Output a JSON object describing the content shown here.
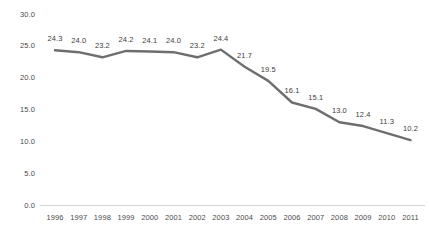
{
  "chart_data": {
    "type": "line",
    "title": "",
    "subtitle": "",
    "xlabel": "",
    "ylabel": "",
    "categories": [
      "1996",
      "1997",
      "1998",
      "1999",
      "2000",
      "2001",
      "2002",
      "2003",
      "2004",
      "2005",
      "2006",
      "2007",
      "2008",
      "2009",
      "2010",
      "2011"
    ],
    "values": [
      24.3,
      24.0,
      23.2,
      24.2,
      24.1,
      24.0,
      23.2,
      24.4,
      21.7,
      19.5,
      16.1,
      15.1,
      13.0,
      12.4,
      11.3,
      10.2
    ],
    "series": [
      {
        "name": "",
        "values": [
          24.3,
          24.0,
          23.2,
          24.2,
          24.1,
          24.0,
          23.2,
          24.4,
          21.7,
          19.5,
          16.1,
          15.1,
          13.0,
          12.4,
          11.3,
          10.2
        ]
      }
    ],
    "data_labels": [
      "24.3",
      "24.0",
      "23.2",
      "24.2",
      "24.1",
      "24.0",
      "23.2",
      "24.4",
      "21.7",
      "19.5",
      "16.1",
      "15.1",
      "13.0",
      "12.4",
      "11.3",
      "10.2"
    ],
    "ylim": [
      0.0,
      30.0
    ],
    "ytick_values": [
      30.0,
      25.0,
      20.0,
      15.0,
      10.0,
      5.0,
      0.0
    ],
    "ytick_labels": [
      "30.0",
      "25.0",
      "20.0",
      "15.0",
      "10.0",
      "5.0",
      "0.0"
    ],
    "grid": false,
    "legend": false,
    "legend_position": "none",
    "line_color": "#6e6e6e",
    "axis_color": "#d4d4d4",
    "label_color": "#4a4a4a",
    "background_color": "#ffffff"
  }
}
